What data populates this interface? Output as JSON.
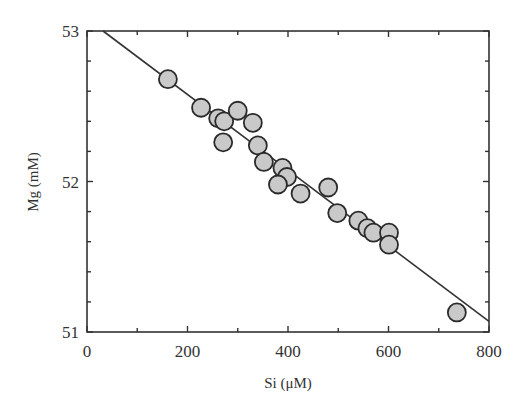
{
  "chart_data": {
    "type": "scatter",
    "title": "",
    "xlabel": "Si (μM)",
    "ylabel": "Mg (mM)",
    "xlim": [
      0,
      800
    ],
    "ylim": [
      51,
      53
    ],
    "x_ticks": [
      0,
      200,
      400,
      600,
      800
    ],
    "y_ticks": [
      51,
      52,
      53
    ],
    "x_tick_labels": [
      "0",
      "200",
      "400",
      "600",
      "800"
    ],
    "y_tick_labels": [
      "51",
      "52",
      "53"
    ],
    "x_minor_step": 100,
    "y_minor_step": 0.2,
    "grid": false,
    "legend": null,
    "series": [
      {
        "name": "observations",
        "marker": "circle",
        "fill": "#c9c9c9",
        "stroke": "#2a2a2a",
        "points": [
          [
            161,
            52.68
          ],
          [
            227,
            52.49
          ],
          [
            261,
            52.42
          ],
          [
            273,
            52.4
          ],
          [
            300,
            52.47
          ],
          [
            330,
            52.39
          ],
          [
            271,
            52.26
          ],
          [
            340,
            52.24
          ],
          [
            352,
            52.13
          ],
          [
            389,
            52.09
          ],
          [
            398,
            52.03
          ],
          [
            380,
            51.98
          ],
          [
            425,
            51.92
          ],
          [
            480,
            51.96
          ],
          [
            498,
            51.79
          ],
          [
            540,
            51.74
          ],
          [
            558,
            51.69
          ],
          [
            570,
            51.66
          ],
          [
            601,
            51.66
          ],
          [
            601,
            51.58
          ],
          [
            736,
            51.13
          ]
        ]
      }
    ],
    "fit_line": {
      "name": "linear fit",
      "color": "#333333",
      "x": [
        32,
        800
      ],
      "y": [
        53.0,
        51.07
      ]
    }
  }
}
